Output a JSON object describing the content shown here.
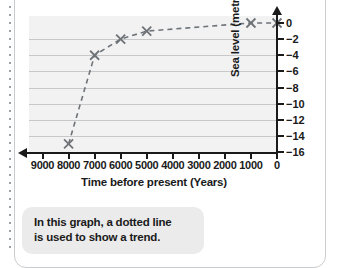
{
  "chart_data": {
    "type": "line",
    "title": "",
    "xlabel": "Time before present (Years)",
    "ylabel": "Sea level (metres)",
    "x": [
      8000,
      7000,
      6000,
      5000,
      1000,
      0
    ],
    "values": [
      -15,
      -4,
      -2,
      -1,
      0,
      0
    ],
    "series": [
      {
        "name": "Sea level",
        "x": [
          8000,
          7000,
          6000,
          5000,
          1000,
          0
        ],
        "values": [
          -15,
          -4,
          -2,
          -1,
          0,
          0
        ]
      }
    ],
    "xticks": [
      "9000",
      "8000",
      "7000",
      "6000",
      "5000",
      "4000",
      "3000",
      "2000",
      "1000",
      "0"
    ],
    "xtick_values": [
      9000,
      8000,
      7000,
      6000,
      5000,
      4000,
      3000,
      2000,
      1000,
      0
    ],
    "yticks": [
      "0",
      "−2",
      "−4",
      "−6",
      "−8",
      "−10",
      "−12",
      "−14",
      "−16"
    ],
    "ytick_values": [
      0,
      -2,
      -4,
      -6,
      -8,
      -10,
      -12,
      -14,
      -16
    ],
    "xlim": [
      9500,
      0
    ],
    "ylim": [
      -16,
      0
    ],
    "grid": true,
    "legend": false,
    "marker": "x",
    "linestyle": "dashed",
    "line_color": "#6e7378",
    "marker_color": "#6e7378",
    "plot_bg": "#f2f2f2",
    "grid_color": "#c8c8c8",
    "axis_color": "#1a1a1a",
    "x_axis_arrow": "left",
    "y_axis_arrow": "up"
  },
  "caption": {
    "bg_color": "#ebebeb",
    "lines": [
      "In this graph, a dotted line",
      "is used to show a trend."
    ]
  },
  "page": {
    "border_color": "#c9ccce",
    "dotted_rule_color": "#9aa0a4"
  }
}
